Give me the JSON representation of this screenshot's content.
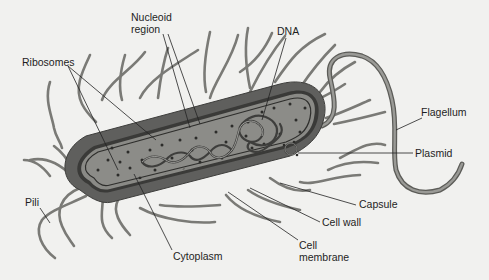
{
  "diagram": {
    "colors": {
      "background": "#f1f1ef",
      "capsule": "#5f5f5d",
      "cell_wall": "#3a3a38",
      "membrane_gap": "#8a8a86",
      "cytoplasm": "#8c8c88",
      "ribosome": "#2c2c2a",
      "dna": "#4a4a48",
      "appendage": "#7a7a76",
      "leader": "#222222",
      "text": "#1e1e1e"
    },
    "labels": {
      "nucleoid_region": "Nucleoid\nregion",
      "ribosomes": "Ribosomes",
      "dna": "DNA",
      "flagellum": "Flagellum",
      "plasmid": "Plasmid",
      "pili": "Pili",
      "capsule": "Capsule",
      "cell_wall": "Cell wall",
      "cell_membrane": "Cell\nmembrane",
      "cytoplasm": "Cytoplasm"
    }
  }
}
